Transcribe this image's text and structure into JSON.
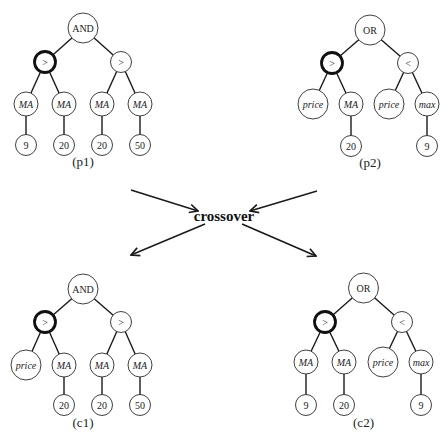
{
  "crossover_label": "crossover",
  "colors": {
    "stroke": "#1a1a1a",
    "background": "#ffffff"
  },
  "trees": [
    {
      "id": "p1",
      "caption": "(p1)",
      "root": {
        "label": "AND",
        "children": [
          {
            "label": ">",
            "highlighted": true,
            "children": [
              {
                "label": "MA",
                "italic": true,
                "children": [
                  {
                    "label": "9"
                  }
                ]
              },
              {
                "label": "MA",
                "italic": true,
                "children": [
                  {
                    "label": "20"
                  }
                ]
              }
            ]
          },
          {
            "label": ">",
            "children": [
              {
                "label": "MA",
                "italic": true,
                "children": [
                  {
                    "label": "20"
                  }
                ]
              },
              {
                "label": "MA",
                "italic": true,
                "children": [
                  {
                    "label": "50"
                  }
                ]
              }
            ]
          }
        ]
      }
    },
    {
      "id": "p2",
      "caption": "(p2)",
      "root": {
        "label": "OR",
        "children": [
          {
            "label": ">",
            "highlighted": true,
            "children": [
              {
                "label": "price",
                "italic": true
              },
              {
                "label": "MA",
                "italic": true,
                "children": [
                  {
                    "label": "20"
                  }
                ]
              }
            ]
          },
          {
            "label": "<",
            "children": [
              {
                "label": "price",
                "italic": true
              },
              {
                "label": "max",
                "italic": true,
                "children": [
                  {
                    "label": "9"
                  }
                ]
              }
            ]
          }
        ]
      }
    },
    {
      "id": "c1",
      "caption": "(c1)",
      "root": {
        "label": "AND",
        "children": [
          {
            "label": ">",
            "highlighted": true,
            "children": [
              {
                "label": "price",
                "italic": true
              },
              {
                "label": "MA",
                "italic": true,
                "children": [
                  {
                    "label": "20"
                  }
                ]
              }
            ]
          },
          {
            "label": ">",
            "children": [
              {
                "label": "MA",
                "italic": true,
                "children": [
                  {
                    "label": "20"
                  }
                ]
              },
              {
                "label": "MA",
                "italic": true,
                "children": [
                  {
                    "label": "50"
                  }
                ]
              }
            ]
          }
        ]
      }
    },
    {
      "id": "c2",
      "caption": "(c2)",
      "root": {
        "label": "OR",
        "children": [
          {
            "label": ">",
            "highlighted": true,
            "children": [
              {
                "label": "MA",
                "italic": true,
                "children": [
                  {
                    "label": "9"
                  }
                ]
              },
              {
                "label": "MA",
                "italic": true,
                "children": [
                  {
                    "label": "20"
                  }
                ]
              }
            ]
          },
          {
            "label": "<",
            "children": [
              {
                "label": "price",
                "italic": true
              },
              {
                "label": "max",
                "italic": true,
                "children": [
                  {
                    "label": "9"
                  }
                ]
              }
            ]
          }
        ]
      }
    }
  ]
}
